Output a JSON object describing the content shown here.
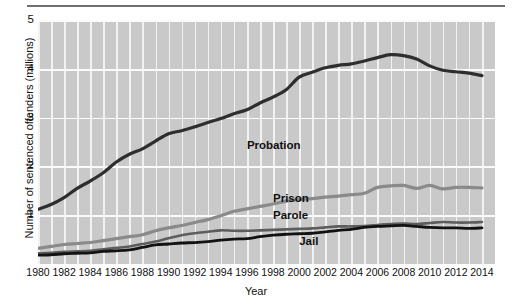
{
  "chart_data": {
    "type": "line",
    "title": "",
    "xlabel": "Year",
    "ylabel": "Number of sentenced offenders (millions)",
    "xlim": [
      1980,
      2015
    ],
    "ylim": [
      0,
      5
    ],
    "ytick_labels": [
      "5",
      "4",
      "3",
      "2",
      "1"
    ],
    "ytick_values": [
      5,
      4,
      3,
      2,
      1
    ],
    "xtick_labels": [
      "1980",
      "1982",
      "1984",
      "1986",
      "1988",
      "1990",
      "1992",
      "1994",
      "1996",
      "1998",
      "2000",
      "2002",
      "2004",
      "2006",
      "2008",
      "2010",
      "2012",
      "2014"
    ],
    "xtick_values": [
      1980,
      1982,
      1984,
      1986,
      1988,
      1990,
      1992,
      1994,
      1996,
      1998,
      2000,
      2002,
      2004,
      2006,
      2008,
      2010,
      2012,
      2014
    ],
    "grid": true,
    "grid_color": "#f7f7f7",
    "plot_background": "#c9c9c9",
    "legend_position": "inline-labels",
    "x": [
      1980,
      1981,
      1982,
      1983,
      1984,
      1985,
      1986,
      1987,
      1988,
      1989,
      1990,
      1991,
      1992,
      1993,
      1994,
      1995,
      1996,
      1997,
      1998,
      1999,
      2000,
      2001,
      2002,
      2003,
      2004,
      2005,
      2006,
      2007,
      2008,
      2009,
      2010,
      2011,
      2012,
      2013,
      2014
    ],
    "series": [
      {
        "name": "Probation",
        "color": "#2e2e2e",
        "width": 3.2,
        "label_x": 1996.0,
        "label_y": 2.42,
        "values": [
          1.12,
          1.22,
          1.36,
          1.55,
          1.7,
          1.87,
          2.09,
          2.25,
          2.36,
          2.52,
          2.67,
          2.73,
          2.81,
          2.9,
          2.98,
          3.08,
          3.16,
          3.3,
          3.42,
          3.57,
          3.83,
          3.93,
          4.02,
          4.07,
          4.1,
          4.16,
          4.23,
          4.29,
          4.27,
          4.2,
          4.06,
          3.97,
          3.94,
          3.91,
          3.86
        ]
      },
      {
        "name": "Prison",
        "color": "#8a8a8a",
        "width": 3.2,
        "label_x": 1998.0,
        "label_y": 1.33,
        "values": [
          0.32,
          0.36,
          0.4,
          0.42,
          0.44,
          0.48,
          0.52,
          0.56,
          0.6,
          0.68,
          0.74,
          0.79,
          0.85,
          0.91,
          0.99,
          1.08,
          1.13,
          1.18,
          1.23,
          1.29,
          1.32,
          1.34,
          1.37,
          1.39,
          1.42,
          1.45,
          1.57,
          1.6,
          1.61,
          1.55,
          1.61,
          1.54,
          1.57,
          1.57,
          1.56
        ]
      },
      {
        "name": "Parole",
        "color": "#5d5d5d",
        "width": 2.6,
        "label_x": 1998.0,
        "label_y": 0.98,
        "values": [
          0.22,
          0.23,
          0.25,
          0.26,
          0.27,
          0.3,
          0.33,
          0.36,
          0.41,
          0.46,
          0.53,
          0.59,
          0.63,
          0.66,
          0.69,
          0.68,
          0.68,
          0.69,
          0.7,
          0.71,
          0.72,
          0.73,
          0.75,
          0.77,
          0.77,
          0.78,
          0.8,
          0.82,
          0.83,
          0.82,
          0.84,
          0.86,
          0.85,
          0.85,
          0.86
        ]
      },
      {
        "name": "Jail",
        "color": "#121212",
        "width": 2.8,
        "label_x": 2000.0,
        "label_y": 0.45,
        "values": [
          0.18,
          0.19,
          0.21,
          0.22,
          0.23,
          0.26,
          0.27,
          0.29,
          0.34,
          0.39,
          0.41,
          0.43,
          0.44,
          0.46,
          0.49,
          0.51,
          0.52,
          0.56,
          0.59,
          0.61,
          0.62,
          0.63,
          0.66,
          0.69,
          0.71,
          0.75,
          0.77,
          0.78,
          0.79,
          0.77,
          0.75,
          0.74,
          0.74,
          0.73,
          0.74
        ]
      }
    ]
  }
}
